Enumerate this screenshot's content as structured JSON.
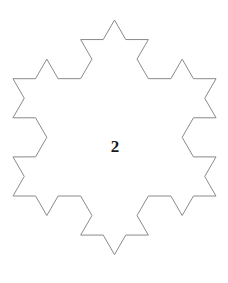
{
  "figure": {
    "type": "koch-snowflake",
    "iteration_label": "2",
    "iteration_level": 2,
    "orientation": "apex-up",
    "canvas": {
      "width": 228,
      "height": 283
    },
    "colors": {
      "background": "#ffffff",
      "stroke": "#8a8a8a",
      "label": "#1a1a1a"
    },
    "stroke_width": 1,
    "fill": "none",
    "geometry": {
      "base_triangle_vertices": [
        {
          "x": 114.5,
          "y": 20.0
        },
        {
          "x": 216.0,
          "y": 196.0
        },
        {
          "x": 13.0,
          "y": 196.0
        }
      ],
      "bounds": {
        "left": 13,
        "right": 216,
        "top": 20,
        "bottom": 276
      },
      "top_apex": {
        "x": 114.5,
        "y": 20
      },
      "bottom_apex": {
        "x": 114.5,
        "y": 276
      },
      "leftmost_point": {
        "x": 13,
        "y": 118
      },
      "rightmost_point": {
        "x": 216,
        "y": 118
      },
      "segments_per_edge": 16,
      "total_segments": 48
    },
    "label_position": {
      "x": 115,
      "y": 147
    }
  }
}
